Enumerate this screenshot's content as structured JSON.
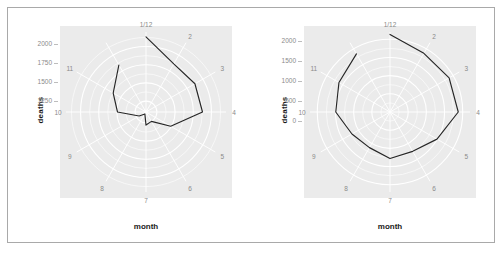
{
  "figure": {
    "background": "#ffffff",
    "frame_color": "#a9a9a9",
    "panel_background": "#ebebeb",
    "grid_color": "#ffffff",
    "line_color": "#262626",
    "tick_text_color": "#8a8a8a",
    "title_text_color": "#1a1a1a"
  },
  "panels": [
    {
      "id": "left",
      "xlabel": "month",
      "ylabel": "deaths",
      "y_ticks": [
        "2000",
        "1750",
        "1500",
        "1250"
      ],
      "theta_labels": [
        "1/12",
        "2",
        "3",
        "4",
        "5",
        "6",
        "7",
        "8",
        "9",
        "10",
        "11"
      ]
    },
    {
      "id": "right",
      "xlabel": "month",
      "ylabel": "deaths",
      "y_ticks": [
        "2000",
        "1500",
        "1000",
        "500",
        "0"
      ],
      "theta_labels": [
        "1/12",
        "2",
        "3",
        "4",
        "5",
        "6",
        "7",
        "8",
        "9",
        "10",
        "11"
      ]
    }
  ],
  "chart_data": [
    {
      "type": "line",
      "id": "left-polar",
      "coord": "polar",
      "title": "",
      "xlabel": "month",
      "ylabel": "deaths",
      "grid": true,
      "legend": false,
      "theta_variable": "month",
      "theta_categories": [
        "1/12",
        "2",
        "3",
        "4",
        "5",
        "6",
        "7",
        "8",
        "9",
        "10",
        "11"
      ],
      "theta_tick_labels": [
        "1/12",
        "2",
        "3",
        "4",
        "5",
        "6",
        "7",
        "8",
        "9",
        "10",
        "11"
      ],
      "r_axis_tick_labels": [
        "2000",
        "1750",
        "1500",
        "1250"
      ],
      "r_axis_tick_values": [
        2000,
        1750,
        1500,
        1250
      ],
      "rlim": [
        1100,
        2200
      ],
      "r_origin_not_zero": true,
      "x": [
        1,
        2,
        3,
        4,
        5,
        6,
        7,
        8,
        9,
        10,
        11,
        12
      ],
      "values": [
        2134,
        1863,
        1877,
        1877,
        1492,
        1249,
        1280,
        1131,
        1209,
        1492,
        1621,
        1846
      ],
      "series": [
        {
          "name": "deaths",
          "values": [
            2134,
            1863,
            1877,
            1877,
            1492,
            1249,
            1280,
            1131,
            1209,
            1492,
            1621,
            1846
          ]
        }
      ]
    },
    {
      "type": "line",
      "id": "right-polar",
      "coord": "polar",
      "title": "",
      "xlabel": "month",
      "ylabel": "deaths",
      "grid": true,
      "legend": false,
      "theta_variable": "month",
      "theta_categories": [
        "1/12",
        "2",
        "3",
        "4",
        "5",
        "6",
        "7",
        "8",
        "9",
        "10",
        "11"
      ],
      "theta_tick_labels": [
        "1/12",
        "2",
        "3",
        "4",
        "5",
        "6",
        "7",
        "8",
        "9",
        "10",
        "11"
      ],
      "r_axis_tick_labels": [
        "2000",
        "1500",
        "1000",
        "500",
        "0"
      ],
      "r_axis_tick_values": [
        2000,
        1500,
        1000,
        500,
        0
      ],
      "rlim": [
        0,
        2200
      ],
      "r_origin_not_zero": false,
      "x": [
        1,
        2,
        3,
        4,
        5,
        6,
        7,
        8,
        9,
        10,
        11,
        12
      ],
      "values": [
        2134,
        1863,
        1877,
        1877,
        1492,
        1249,
        1280,
        1131,
        1209,
        1492,
        1621,
        1846
      ],
      "series": [
        {
          "name": "deaths",
          "values": [
            2134,
            1863,
            1877,
            1877,
            1492,
            1249,
            1280,
            1131,
            1209,
            1492,
            1621,
            1846
          ]
        }
      ]
    }
  ]
}
